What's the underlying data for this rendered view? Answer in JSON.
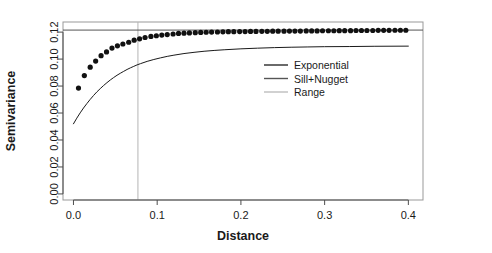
{
  "chart_data": {
    "type": "scatter",
    "title": "",
    "subtitle": "",
    "xlabel": "Distance",
    "ylabel": "Semivariance",
    "xlim": [
      -0.0125,
      0.4175
    ],
    "ylim": [
      -0.0045,
      0.1275
    ],
    "xticks": [
      0.0,
      0.1,
      0.2,
      0.3,
      0.4
    ],
    "xticklabels": [
      "0.0",
      "0.1",
      "0.2",
      "0.3",
      "0.4"
    ],
    "yticks": [
      0.0,
      0.02,
      0.04,
      0.06,
      0.08,
      0.1,
      0.12
    ],
    "yticklabels": [
      "0.00",
      "0.02",
      "0.04",
      "0.06",
      "0.08",
      "0.10",
      "0.12"
    ],
    "grid": false,
    "legend_position": "center-right",
    "series": [
      {
        "name": "Exponential",
        "type": "line",
        "color": "#1a1a1a",
        "linewidth": 1.0,
        "nugget": 0.052,
        "sill_partial": 0.0695,
        "range": 0.077,
        "x": [
          0.0,
          0.004,
          0.008,
          0.012,
          0.016,
          0.02,
          0.024,
          0.028,
          0.032,
          0.036,
          0.04,
          0.044,
          0.048,
          0.052,
          0.056,
          0.06,
          0.064,
          0.068,
          0.072,
          0.076,
          0.08,
          0.088,
          0.096,
          0.104,
          0.112,
          0.12,
          0.132,
          0.144,
          0.156,
          0.168,
          0.18,
          0.2,
          0.22,
          0.24,
          0.26,
          0.28,
          0.3,
          0.33,
          0.36,
          0.4
        ],
        "y": [
          0.052,
          0.0562,
          0.0601,
          0.0637,
          0.067,
          0.0701,
          0.073,
          0.0757,
          0.0781,
          0.0804,
          0.0825,
          0.0845,
          0.0863,
          0.088,
          0.0895,
          0.0909,
          0.0923,
          0.0935,
          0.0946,
          0.0957,
          0.0966,
          0.0983,
          0.0997,
          0.1009,
          0.102,
          0.1029,
          0.1041,
          0.105,
          0.1058,
          0.1064,
          0.1069,
          0.1076,
          0.1081,
          0.1085,
          0.1088,
          0.109,
          0.1092,
          0.1093,
          0.1095,
          0.1096
        ]
      },
      {
        "name": "Empirical semivariance",
        "type": "points",
        "color": "#111111",
        "marker": "filled-circle",
        "markersize": 2.6,
        "x": [
          0.006,
          0.013,
          0.02,
          0.0265,
          0.033,
          0.0395,
          0.046,
          0.0525,
          0.059,
          0.066,
          0.0725,
          0.079,
          0.0855,
          0.0925,
          0.099,
          0.1055,
          0.112,
          0.119,
          0.1255,
          0.132,
          0.1385,
          0.1455,
          0.152,
          0.1585,
          0.165,
          0.172,
          0.1785,
          0.185,
          0.1915,
          0.1985,
          0.205,
          0.2115,
          0.218,
          0.225,
          0.2315,
          0.238,
          0.2445,
          0.2515,
          0.258,
          0.2645,
          0.271,
          0.278,
          0.2845,
          0.291,
          0.2975,
          0.3045,
          0.311,
          0.3175,
          0.324,
          0.331,
          0.3375,
          0.344,
          0.3505,
          0.3575,
          0.364,
          0.3705,
          0.377,
          0.384,
          0.3905,
          0.397
        ],
        "y": [
          0.0785,
          0.0878,
          0.094,
          0.0985,
          0.1025,
          0.1053,
          0.1082,
          0.1098,
          0.1112,
          0.1125,
          0.114,
          0.115,
          0.116,
          0.1168,
          0.1173,
          0.1178,
          0.1182,
          0.1186,
          0.119,
          0.1192,
          0.1194,
          0.1196,
          0.1198,
          0.1199,
          0.12,
          0.1201,
          0.1202,
          0.1203,
          0.1203,
          0.1204,
          0.1204,
          0.1205,
          0.1205,
          0.1206,
          0.1206,
          0.1207,
          0.1207,
          0.1207,
          0.1208,
          0.1208,
          0.1208,
          0.1209,
          0.1209,
          0.1209,
          0.121,
          0.121,
          0.121,
          0.1211,
          0.1211,
          0.1211,
          0.1212,
          0.1212,
          0.1212,
          0.1212,
          0.1213,
          0.1213,
          0.1213,
          0.1214,
          0.1214,
          0.1214
        ]
      },
      {
        "name": "Sill+Nugget",
        "type": "hline",
        "color": "#555555",
        "linewidth": 1.0,
        "value": 0.1215
      },
      {
        "name": "Range",
        "type": "vline",
        "color": "#b4b4b4",
        "linewidth": 1.0,
        "value": 0.077
      }
    ],
    "legend_entries": [
      {
        "label": "Exponential",
        "color": "#2a2a2a"
      },
      {
        "label": "Sill+Nugget",
        "color": "#555555"
      },
      {
        "label": "Range",
        "color": "#bdbdbd"
      }
    ]
  },
  "axes": {
    "x_title": "Distance",
    "y_title": "Semivariance"
  },
  "colors": {
    "frame": "#999999",
    "curve": "#1a1a1a",
    "points": "#111111",
    "sill": "#555555",
    "range": "#b4b4b4",
    "text": "#1a1a1a",
    "background": "#ffffff"
  }
}
